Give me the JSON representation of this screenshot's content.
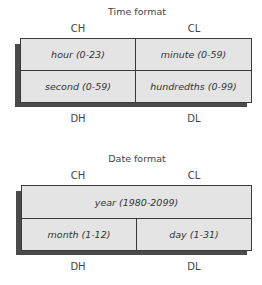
{
  "time_format": {
    "title": "Time format",
    "top_labels": [
      "CH",
      "CL"
    ],
    "bottom_labels": [
      "DH",
      "DL"
    ],
    "rows": [
      [
        "hour (0-23)",
        "minute (0-59)"
      ],
      [
        "second (0-59)",
        "hundredths (0-99)"
      ]
    ]
  },
  "date_format": {
    "title": "Date format",
    "top_labels": [
      "CH",
      "CL"
    ],
    "bottom_labels": [
      "DH",
      "DL"
    ],
    "year_cell": "year (1980-2099)",
    "bottom_row": [
      "month (1-12)",
      "day (1-31)"
    ]
  }
}
